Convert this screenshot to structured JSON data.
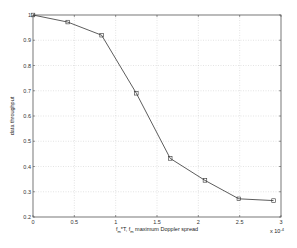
{
  "chart_data": {
    "type": "line",
    "title": "",
    "xlabel": "f_m*T, f_m maximum Doppler spread",
    "ylabel": "data throughput",
    "x_multiplier": "x 10^-4",
    "xlim": [
      0,
      3
    ],
    "ylim": [
      0.2,
      1.0
    ],
    "xticks": [
      "0",
      "0.5",
      "1",
      "1.5",
      "2",
      "2.5",
      "3"
    ],
    "yticks": [
      "0.2",
      "0.3",
      "0.4",
      "0.5",
      "0.6",
      "0.7",
      "0.8",
      "0.9",
      "1"
    ],
    "grid": true,
    "legend": null,
    "series": [
      {
        "name": "throughput",
        "marker": "square",
        "color": "#333333",
        "x": [
          0,
          0.42,
          0.83,
          1.25,
          1.66,
          2.08,
          2.49,
          2.91
        ],
        "y": [
          1.0,
          0.972,
          0.92,
          0.69,
          0.432,
          0.345,
          0.272,
          0.265
        ]
      }
    ]
  },
  "labels": {
    "xlabel_f": "f",
    "xlabel_sub1": "m",
    "xlabel_mid": "*T, f",
    "xlabel_sub2": "m",
    "xlabel_rest": " maximum Doppler spread",
    "ylabel": "data throughput",
    "mult_base": "x 10",
    "mult_exp": "-4"
  }
}
